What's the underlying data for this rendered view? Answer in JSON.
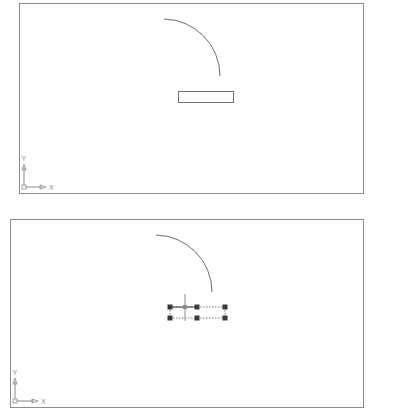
{
  "colors": {
    "border": "#8c8c8c",
    "geometry": "#6e6e6e",
    "grip": "#3a3a3a",
    "dashed": "#7a7a7a",
    "ucs": "#8a8a8a"
  },
  "viewports": [
    {
      "name": "before-selection",
      "ucs": {
        "x_label": "X",
        "y_label": "Y"
      },
      "objects": [
        {
          "type": "arc",
          "state": "unselected"
        },
        {
          "type": "rectangle",
          "state": "unselected"
        }
      ]
    },
    {
      "name": "after-selection",
      "ucs": {
        "x_label": "X",
        "y_label": "Y"
      },
      "objects": [
        {
          "type": "arc",
          "state": "unselected"
        },
        {
          "type": "rectangle",
          "state": "selected-with-grips",
          "grip_count": 6
        }
      ],
      "cursor": "crosshair"
    }
  ]
}
